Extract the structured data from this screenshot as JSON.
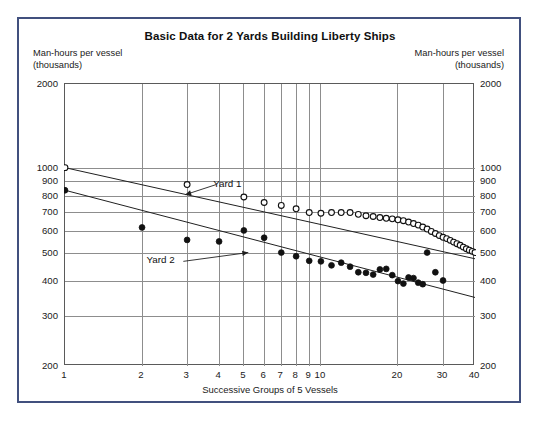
{
  "figure": {
    "title": "Basic Data for 2 Yards Building Liberty Ships",
    "left_caption_line1": "Man-hours per vessel",
    "left_caption_line2": "(thousands)",
    "right_caption_line1": "Man-hours per vessel",
    "right_caption_line2": "(thousands)",
    "xaxis_title": "Successive Groups of 5 Vessels",
    "frame_color": "#41507e",
    "axis_color": "#5a5a5a",
    "grid_color": "#8d8d8d",
    "marker_color": "#111111"
  },
  "chart_data": {
    "type": "scatter",
    "title": "Basic Data for 2 Yards Building Liberty Ships",
    "xlabel": "Successive Groups of 5 Vessels",
    "ylabel": "Man-hours per vessel (thousands)",
    "xscale": "log",
    "yscale": "log",
    "xlim": [
      1,
      40
    ],
    "ylim": [
      200,
      2000
    ],
    "grid": true,
    "legend_position": "inline-annotation",
    "xticks": [
      1,
      2,
      3,
      4,
      5,
      6,
      7,
      8,
      9,
      10,
      20,
      30,
      40
    ],
    "xtick_labels": [
      "1",
      "2",
      "3",
      "4",
      "5",
      "6",
      "7",
      "8",
      "9",
      "10",
      "20",
      "30",
      "40"
    ],
    "yticks": [
      200,
      300,
      400,
      500,
      600,
      700,
      800,
      900,
      1000,
      2000
    ],
    "ytick_labels": [
      "200",
      "300",
      "400",
      "500",
      "600",
      "700",
      "800",
      "900",
      "1000",
      "2000"
    ],
    "annotations": [
      {
        "text": "Yard 1",
        "x": 3.9,
        "y": 880,
        "arrow_to_x": 2.95,
        "arrow_to_y": 810
      },
      {
        "text": "Yard 2",
        "x": 2.9,
        "y": 470,
        "arrow_to_x": 5.2,
        "arrow_to_y": 505
      }
    ],
    "series": [
      {
        "name": "Yard 1",
        "marker": "open-circle",
        "trendline": {
          "x": [
            1,
            40
          ],
          "y": [
            1010,
            480
          ]
        },
        "points": [
          {
            "x": 1,
            "y": 1010
          },
          {
            "x": 3,
            "y": 880
          },
          {
            "x": 5,
            "y": 795
          },
          {
            "x": 6,
            "y": 760
          },
          {
            "x": 7,
            "y": 742
          },
          {
            "x": 8,
            "y": 722
          },
          {
            "x": 9,
            "y": 700
          },
          {
            "x": 10,
            "y": 696
          },
          {
            "x": 11,
            "y": 700
          },
          {
            "x": 12,
            "y": 700
          },
          {
            "x": 13,
            "y": 700
          },
          {
            "x": 14,
            "y": 690
          },
          {
            "x": 15,
            "y": 682
          },
          {
            "x": 16,
            "y": 678
          },
          {
            "x": 17,
            "y": 672
          },
          {
            "x": 18,
            "y": 668
          },
          {
            "x": 19,
            "y": 665
          },
          {
            "x": 20,
            "y": 660
          },
          {
            "x": 21,
            "y": 655
          },
          {
            "x": 22,
            "y": 648
          },
          {
            "x": 23,
            "y": 640
          },
          {
            "x": 24,
            "y": 632
          },
          {
            "x": 25,
            "y": 622
          },
          {
            "x": 26,
            "y": 612
          },
          {
            "x": 27,
            "y": 600
          },
          {
            "x": 28,
            "y": 590
          },
          {
            "x": 29,
            "y": 580
          },
          {
            "x": 30,
            "y": 572
          },
          {
            "x": 31,
            "y": 566
          },
          {
            "x": 32,
            "y": 558
          },
          {
            "x": 33,
            "y": 550
          },
          {
            "x": 34,
            "y": 543
          },
          {
            "x": 35,
            "y": 536
          },
          {
            "x": 36,
            "y": 528
          },
          {
            "x": 37,
            "y": 521
          },
          {
            "x": 38,
            "y": 515
          },
          {
            "x": 39,
            "y": 510
          },
          {
            "x": 40,
            "y": 505
          }
        ]
      },
      {
        "name": "Yard 2",
        "marker": "filled-circle",
        "trendline": {
          "x": [
            1,
            40
          ],
          "y": [
            840,
            350
          ]
        },
        "points": [
          {
            "x": 1,
            "y": 840
          },
          {
            "x": 2,
            "y": 620
          },
          {
            "x": 3,
            "y": 560
          },
          {
            "x": 4,
            "y": 553
          },
          {
            "x": 5,
            "y": 605
          },
          {
            "x": 6,
            "y": 570
          },
          {
            "x": 7,
            "y": 505
          },
          {
            "x": 8,
            "y": 490
          },
          {
            "x": 9,
            "y": 472
          },
          {
            "x": 10,
            "y": 470
          },
          {
            "x": 11,
            "y": 455
          },
          {
            "x": 12,
            "y": 465
          },
          {
            "x": 13,
            "y": 450
          },
          {
            "x": 14,
            "y": 430
          },
          {
            "x": 15,
            "y": 428
          },
          {
            "x": 16,
            "y": 422
          },
          {
            "x": 17,
            "y": 440
          },
          {
            "x": 18,
            "y": 442
          },
          {
            "x": 19,
            "y": 420
          },
          {
            "x": 20,
            "y": 400
          },
          {
            "x": 21,
            "y": 392
          },
          {
            "x": 22,
            "y": 412
          },
          {
            "x": 23,
            "y": 410
          },
          {
            "x": 24,
            "y": 395
          },
          {
            "x": 25,
            "y": 390
          },
          {
            "x": 26,
            "y": 505
          },
          {
            "x": 28,
            "y": 430
          },
          {
            "x": 30,
            "y": 402
          }
        ]
      }
    ]
  }
}
